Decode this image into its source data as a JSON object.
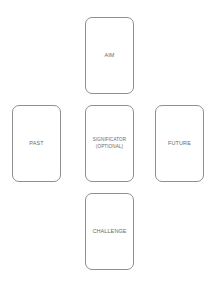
{
  "diagram": {
    "type": "tarot-spread-layout",
    "cards": [
      {
        "id": "aim",
        "label": "AIM",
        "position": "top"
      },
      {
        "id": "past",
        "label": "PAST",
        "position": "left"
      },
      {
        "id": "significator",
        "label": "SIGNIFICATOR",
        "sublabel": "(OPTIONAL)",
        "position": "center"
      },
      {
        "id": "future",
        "label": "FUTURE",
        "position": "right"
      },
      {
        "id": "challenge",
        "label": "CHALLENGE",
        "position": "bottom"
      }
    ],
    "colors": {
      "card_border": "#8f8f8f",
      "label_text": "#6a6a6a",
      "background": "#ffffff"
    }
  }
}
